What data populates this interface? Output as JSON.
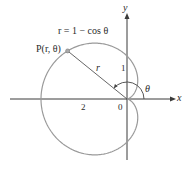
{
  "figure": {
    "equation": "r = 1 − cos θ",
    "point_label": "P(r, θ)",
    "radius_label": "r",
    "angle_label": "θ",
    "axis_x_label": "x",
    "axis_y_label": "y",
    "tick_labels": {
      "origin": "0",
      "x_neg_2": "2",
      "y_1": "1"
    },
    "colors": {
      "curve": "#9a9a9a",
      "axes": "#3a3a3a",
      "text": "#2a2a2a",
      "point": "#8a8a8a"
    },
    "geometry": {
      "origin_px": [
        127,
        99
      ],
      "scale_px_per_unit": 43,
      "point_theta_deg": 141
    }
  }
}
